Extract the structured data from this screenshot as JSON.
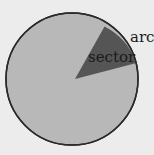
{
  "diagram": {
    "labels": {
      "sector": "sector",
      "arc": "arc"
    },
    "colors": {
      "background": "#ececec",
      "circle_fill": "#b8b8b8",
      "sector_fill": "#555555",
      "outline": "#2a2a2a",
      "text": "#1a1a1a"
    }
  }
}
